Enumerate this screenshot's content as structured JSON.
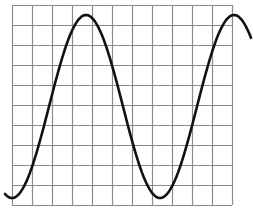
{
  "figure": {
    "grid": {
      "left": 12,
      "top": 5,
      "cell": 20,
      "cols": 11,
      "rows": 10,
      "color": "#8a8a8a"
    },
    "curve": {
      "type": "sine",
      "color": "#111111",
      "stroke_width": 2.6,
      "x_start": 5,
      "x_end": 251,
      "center_y": 106.5,
      "amplitude": 91.5,
      "period_px": 148,
      "peak_x": 86
    }
  }
}
